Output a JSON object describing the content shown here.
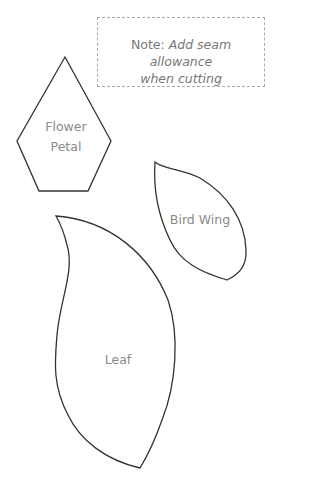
{
  "note": {
    "prefix": "Note: ",
    "line1_italic": "Add seam allowance",
    "line2_italic": "when cutting"
  },
  "shapes": [
    {
      "id": "flower-petal",
      "label_line1": "Flower",
      "label_line2": "Petal"
    },
    {
      "id": "bird-wing",
      "label": "Bird Wing"
    },
    {
      "id": "leaf",
      "label": "Leaf"
    }
  ],
  "colors": {
    "outline": "#333333",
    "label_text": "#8a8a8a",
    "note_border": "#aaaaaa"
  }
}
